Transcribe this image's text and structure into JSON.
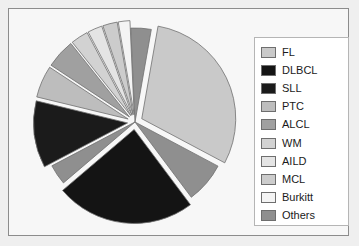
{
  "figure": {
    "background": "#efefef",
    "frame_border": "#8c8c8c",
    "plot_background": "#f7f7f7"
  },
  "legend": {
    "position": "right",
    "background": "#ffffff",
    "border": "#b5b5b5",
    "items": [
      {
        "label": "FL",
        "color": "#c9c9c9"
      },
      {
        "label": "DLBCL",
        "color": "#141414"
      },
      {
        "label": "SLL",
        "color": "#1b1b1b"
      },
      {
        "label": "PTC",
        "color": "#bdbdbd"
      },
      {
        "label": "ALCL",
        "color": "#a0a0a0"
      },
      {
        "label": "WM",
        "color": "#d2d2d2"
      },
      {
        "label": "AILD",
        "color": "#e4e4e4"
      },
      {
        "label": "MCL",
        "color": "#cccccc"
      },
      {
        "label": "Burkitt",
        "color": "#f4f4f4"
      },
      {
        "label": "Others",
        "color": "#8f8f8f"
      }
    ]
  },
  "chart_data": {
    "type": "pie",
    "title": "",
    "labels": [
      "FL",
      "DLBCL",
      "SLL",
      "PTC",
      "ALCL",
      "WM",
      "AILD",
      "MCL",
      "Burkitt",
      "Others"
    ],
    "values": [
      30.0,
      24.0,
      11.5,
      5.5,
      5.0,
      3.0,
      2.5,
      2.5,
      2.0,
      14.0
    ],
    "colors": [
      "#c9c9c9",
      "#141414",
      "#1b1b1b",
      "#bdbdbd",
      "#a0a0a0",
      "#d2d2d2",
      "#e4e4e4",
      "#cccccc",
      "#f4f4f4",
      "#8f8f8f"
    ],
    "exploded": [
      true,
      true,
      true,
      true,
      true,
      true,
      true,
      true,
      true,
      false
    ],
    "start_angle_deg": -80,
    "direction": "clockwise",
    "edge_color": "#707070",
    "show_labels": false,
    "show_percentages": false,
    "legend_position": "right",
    "slices": [
      {
        "label": "FL",
        "value": 30.0,
        "color": "#c9c9c9",
        "exploded": true
      },
      {
        "label": "Others",
        "value": 7.0,
        "color": "#8f8f8f",
        "exploded": false
      },
      {
        "label": "DLBCL",
        "value": 24.0,
        "color": "#141414",
        "exploded": true
      },
      {
        "label": "Others",
        "value": 3.5,
        "color": "#8f8f8f",
        "exploded": false
      },
      {
        "label": "SLL",
        "value": 11.5,
        "color": "#1b1b1b",
        "exploded": true
      },
      {
        "label": "PTC",
        "value": 5.5,
        "color": "#bdbdbd",
        "exploded": true
      },
      {
        "label": "ALCL",
        "value": 5.0,
        "color": "#a0a0a0",
        "exploded": true
      },
      {
        "label": "WM",
        "value": 3.0,
        "color": "#d2d2d2",
        "exploded": true
      },
      {
        "label": "AILD",
        "value": 2.5,
        "color": "#e4e4e4",
        "exploded": true
      },
      {
        "label": "MCL",
        "value": 2.5,
        "color": "#cccccc",
        "exploded": true
      },
      {
        "label": "Burkitt",
        "value": 2.0,
        "color": "#f4f4f4",
        "exploded": true
      },
      {
        "label": "Others",
        "value": 3.5,
        "color": "#8f8f8f",
        "exploded": false
      }
    ]
  }
}
